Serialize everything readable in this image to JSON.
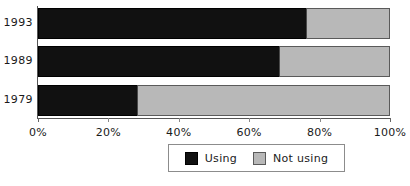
{
  "chart_data": {
    "type": "bar",
    "orientation": "horizontal",
    "stacked": true,
    "normalized": true,
    "title": "",
    "xlabel": "",
    "ylabel": "",
    "categories": [
      "1993",
      "1989",
      "1979"
    ],
    "series": [
      {
        "name": "Using",
        "color": "#111111",
        "values": [
          76,
          68.5,
          28
        ]
      },
      {
        "name": "Not using",
        "color": "#b8b8b8",
        "values": [
          24,
          31.5,
          72
        ]
      }
    ],
    "xlim": [
      0,
      100
    ],
    "xticks": [
      0,
      20,
      40,
      60,
      80,
      100
    ],
    "xtick_labels": [
      "0%",
      "20%",
      "40%",
      "60%",
      "80%",
      "100%"
    ],
    "grid": false,
    "legend_position": "bottom-center"
  },
  "legend": {
    "entries": [
      {
        "label": "Using",
        "swatch": "black-swatch-icon"
      },
      {
        "label": "Not using",
        "swatch": "gray-swatch-icon"
      }
    ]
  },
  "colors": {
    "using": "#111111",
    "not_using": "#b8b8b8",
    "axis": "#555555",
    "text": "#1a1a1a",
    "background": "#ffffff"
  }
}
